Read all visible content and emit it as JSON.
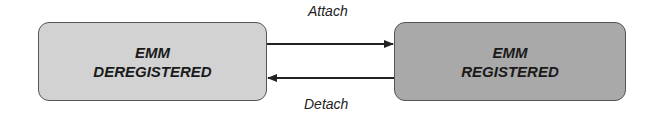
{
  "diagram": {
    "type": "state-transition",
    "states": [
      {
        "id": "deregistered",
        "line1": "EMM",
        "line2": "DEREGISTERED",
        "fill": "#d2d2d2"
      },
      {
        "id": "registered",
        "line1": "EMM",
        "line2": "REGISTERED",
        "fill": "#a9a9a9"
      }
    ],
    "transitions": [
      {
        "from": "deregistered",
        "to": "registered",
        "label": "Attach"
      },
      {
        "from": "registered",
        "to": "deregistered",
        "label": "Detach"
      }
    ],
    "colors": {
      "border": "#555555",
      "arrow": "#222222",
      "text": "#1a1a1a"
    }
  }
}
